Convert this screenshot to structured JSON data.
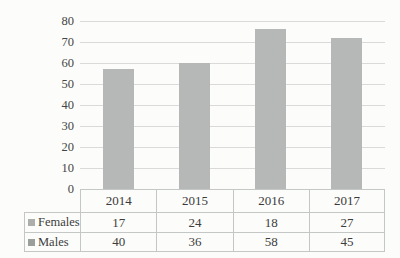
{
  "chart_data": {
    "type": "bar",
    "subtype": "stacked-column-with-data-table",
    "title": "",
    "xlabel": "",
    "ylabel": "",
    "categories": [
      "2014",
      "2015",
      "2016",
      "2017"
    ],
    "series": [
      {
        "name": "Females",
        "values": [
          17,
          24,
          18,
          27
        ],
        "key_color": "#abaeab"
      },
      {
        "name": "Males",
        "values": [
          40,
          36,
          58,
          45
        ],
        "key_color": "#9b9f9c"
      }
    ],
    "totals": [
      57,
      60,
      76,
      72
    ],
    "ylim": [
      0,
      80
    ],
    "yticks": [
      0,
      10,
      20,
      30,
      40,
      50,
      60,
      70,
      80
    ],
    "grid": true,
    "legend_position": "data-table-keys",
    "bar_color": "#b5b8b6",
    "gridline_color": "#d9dbda",
    "table_border_color": "#c3c7c5"
  }
}
